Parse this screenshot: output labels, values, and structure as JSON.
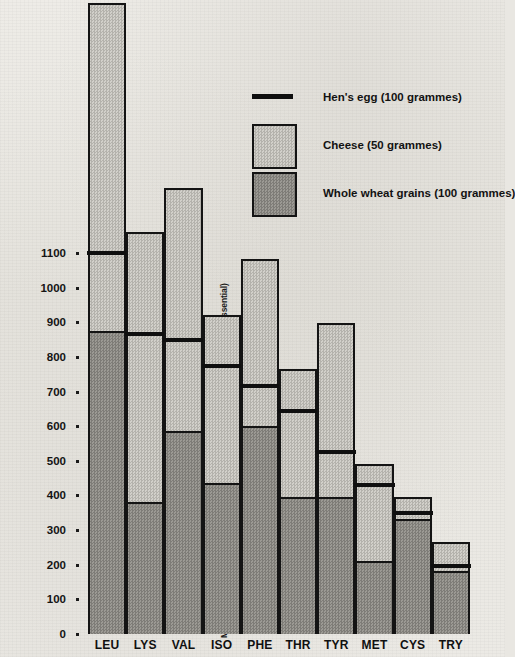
{
  "chart_data": {
    "type": "bar",
    "title": "",
    "subtitle": "",
    "xlabel": "",
    "ylabel": "Milligrammes of essential amino-acids* approx: *(Tyrosine and cystine are semi-essential)",
    "ylim": [
      0,
      1900
    ],
    "grid": false,
    "legend_position": "top-right",
    "note": "Overlaid bars: cheese (tallest, light stipple), whole wheat grains (dark stipple, drawn in front), hen's egg shown as a heavy horizontal rule across each column.",
    "categories": [
      "LEU",
      "LYS",
      "VAL",
      "ISO",
      "PHE",
      "THR",
      "TYR",
      "MET",
      "CYS",
      "TRY"
    ],
    "series": [
      {
        "name": "Cheese (50 grammes)",
        "style": "light-stipple-bar",
        "color": "#c3c1bb",
        "values": [
          1810,
          1150,
          1275,
          910,
          1070,
          755,
          885,
          480,
          385,
          255
        ]
      },
      {
        "name": "Hen's egg (100 grammes)",
        "style": "black-rule",
        "color": "#0f0f0f",
        "values": [
          1100,
          865,
          850,
          775,
          715,
          645,
          525,
          430,
          350,
          195
        ]
      },
      {
        "name": "Whole wheat grains (100 grammes)",
        "style": "dark-stipple-bar",
        "color": "#8e8c86",
        "values": [
          870,
          375,
          580,
          430,
          595,
          390,
          390,
          205,
          325,
          175
        ]
      }
    ],
    "ticks": [
      0,
      100,
      200,
      300,
      400,
      500,
      600,
      700,
      800,
      900,
      1000,
      1100
    ],
    "tick_labels": [
      "0",
      "100",
      "200",
      "300",
      "400",
      "500",
      "600",
      "700",
      "800",
      "900",
      "1000",
      "1100"
    ]
  },
  "legend": {
    "items": [
      {
        "label": "Hen's egg (100 grammes)",
        "key": "black-rule"
      },
      {
        "label": "Cheese (50 grammes)",
        "key": "light-stipple-swatch"
      },
      {
        "label": "Whole wheat grains (100 grammes)",
        "key": "dark-stipple-swatch"
      }
    ]
  }
}
